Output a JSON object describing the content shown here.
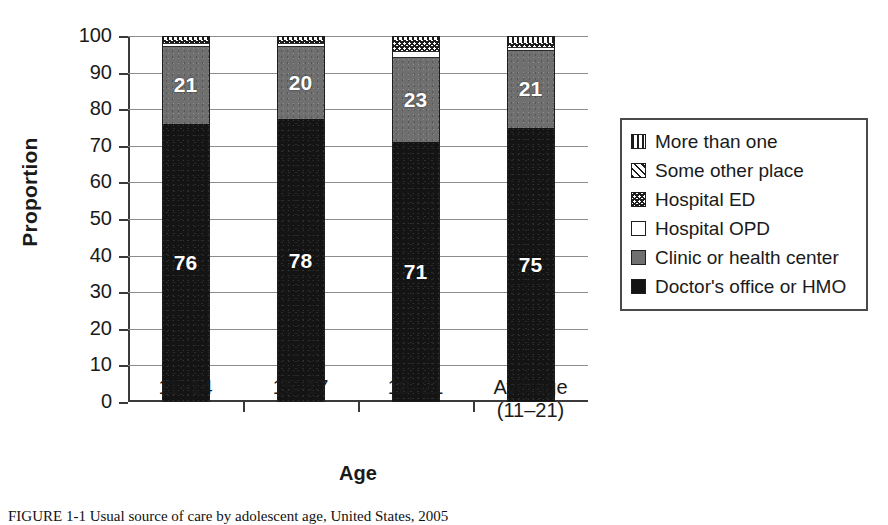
{
  "chart_data": {
    "type": "bar",
    "subtype": "stacked-bar-100",
    "title": "",
    "xlabel": "Age",
    "ylabel": "Proportion",
    "ylim": [
      0,
      100
    ],
    "ytick_step": 10,
    "yticks": [
      "100",
      "90",
      "80",
      "70",
      "60",
      "50",
      "40",
      "30",
      "20",
      "10",
      "0"
    ],
    "grid": true,
    "grid_axis": "y",
    "legend_position": "right-outside",
    "categories": [
      "11–14",
      "15–17",
      "18–21",
      "Average\n(11–21)"
    ],
    "series": [
      {
        "name": "Doctor's office or HMO",
        "values": [
          76,
          78,
          71,
          75
        ],
        "labels": [
          "76",
          "78",
          "71",
          "75"
        ],
        "pattern": "solid-black",
        "color": "#141414"
      },
      {
        "name": "Clinic or health center",
        "values": [
          21,
          20,
          23,
          21
        ],
        "labels": [
          "21",
          "20",
          "23",
          "21"
        ],
        "pattern": "solid-gray",
        "color": "#6f6f6f"
      },
      {
        "name": "Hospital OPD",
        "values": [
          1,
          1,
          2,
          1
        ],
        "labels": [
          "",
          "",
          "",
          ""
        ],
        "pattern": "solid-white",
        "color": "#ffffff"
      },
      {
        "name": "Hospital ED",
        "values": [
          1,
          1,
          3,
          1
        ],
        "labels": [
          "",
          "",
          "",
          ""
        ],
        "pattern": "checker",
        "color": "#ffffff"
      },
      {
        "name": "Some other place",
        "values": [
          0,
          0,
          0,
          0
        ],
        "labels": [
          "",
          "",
          "",
          ""
        ],
        "pattern": "diagonal-hatch",
        "color": "#ffffff"
      },
      {
        "name": "More than one",
        "values": [
          1,
          1,
          1,
          2
        ],
        "labels": [
          "",
          "",
          "",
          ""
        ],
        "pattern": "vertical-stripes",
        "color": "#ffffff"
      }
    ]
  },
  "axes": {
    "y_title": "Proportion",
    "x_title": "Age"
  },
  "legend": {
    "items": [
      {
        "label": "More than one",
        "swatch": "vertical-stripes-swatch"
      },
      {
        "label": "Some other place",
        "swatch": "diagonal-hatch-swatch"
      },
      {
        "label": "Hospital ED",
        "swatch": "checker-swatch"
      },
      {
        "label": "Hospital OPD",
        "swatch": "white-swatch"
      },
      {
        "label": "Clinic or health center",
        "swatch": "gray-swatch"
      },
      {
        "label": "Doctor's office or HMO",
        "swatch": "black-swatch"
      }
    ]
  },
  "caption": {
    "text": "FIGURE 1-1  Usual source of care by adolescent age, United States, 2005"
  }
}
